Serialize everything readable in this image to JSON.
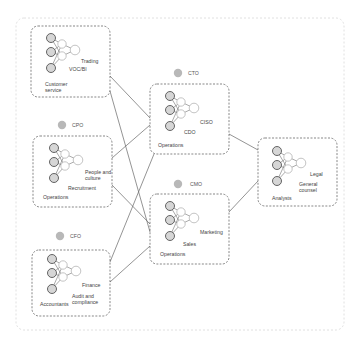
{
  "diagram": {
    "type": "organizational-network",
    "colors": {
      "outer_border": "#d8d8d8",
      "group_border": "#555555",
      "connector": "#666666",
      "input_node_fill": "#d6d6d6",
      "input_node_stroke": "#555555",
      "hidden_node_stroke": "#aaaaaa",
      "role_badge": "#b8b8b8"
    },
    "groups": [
      {
        "id": "g1",
        "role": "",
        "labels": {
          "bottom_left": [
            "Customer",
            "service"
          ],
          "mid": "VOC/BI",
          "right": "Trading"
        }
      },
      {
        "id": "g2",
        "role": "CPO",
        "labels": {
          "bottom_left": [
            "Operations"
          ],
          "mid": "Recruitment",
          "right": [
            "People and",
            "culture"
          ]
        }
      },
      {
        "id": "g3",
        "role": "CFO",
        "labels": {
          "bottom_left": [
            "Accountants"
          ],
          "mid": [
            "Audit and",
            "compliance"
          ],
          "right": "Finance"
        }
      },
      {
        "id": "g4",
        "role": "CTO",
        "labels": {
          "bottom_left": [
            "Operations"
          ],
          "mid": "CDO",
          "right": "CISO"
        }
      },
      {
        "id": "g5",
        "role": "CMO",
        "labels": {
          "bottom_left": [
            "Operations"
          ],
          "mid": "Sales",
          "right": "Marketing"
        }
      },
      {
        "id": "g6",
        "role": "",
        "labels": {
          "bottom_left": [
            "Analysts"
          ],
          "mid": [
            "General",
            "counsel"
          ],
          "right": "Legal"
        }
      }
    ],
    "connections": [
      {
        "from": "g1",
        "to": "g4"
      },
      {
        "from": "g1",
        "to": "g5"
      },
      {
        "from": "g2",
        "to": "g4"
      },
      {
        "from": "g2",
        "to": "g5"
      },
      {
        "from": "g3",
        "to": "g4"
      },
      {
        "from": "g3",
        "to": "g5"
      },
      {
        "from": "g4",
        "to": "g6"
      },
      {
        "from": "g5",
        "to": "g6"
      }
    ]
  }
}
